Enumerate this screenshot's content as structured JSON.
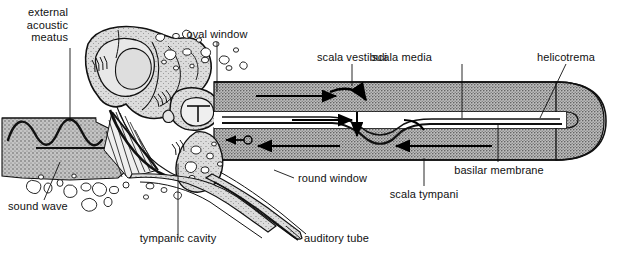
{
  "figure": {
    "type": "anatomical-diagram",
    "width": 622,
    "height": 257,
    "background_color": "#ffffff",
    "ink_color": "#111111",
    "bone_fill": "#c9c9c9",
    "cochlea_fill": "#b5b5b5",
    "duct_fill": "#ffffff",
    "font_size_px": 11
  },
  "labels": {
    "external_acoustic_meatus": "external\nacoustic\nmeatus",
    "oval_window": "oval window",
    "scala_vestibuli": "scala vestibuli",
    "scala_media": "scala media",
    "helicotrema": "helicotrema",
    "basilar_membrane": "basilar membrane",
    "scala_tympani": "scala tympani",
    "round_window": "round window",
    "auditory_tube": "auditory tube",
    "tympanic_cavity": "tympanic cavity",
    "sound_wave": "sound wave"
  },
  "structures": [
    {
      "name": "external-acoustic-meatus",
      "region": "outer-ear-canal"
    },
    {
      "name": "tympanic-membrane",
      "region": "eardrum-fan"
    },
    {
      "name": "tympanic-cavity",
      "region": "middle-ear"
    },
    {
      "name": "auditory-tube",
      "region": "eustachian-tube"
    },
    {
      "name": "oval-window",
      "region": "vestibule-entry"
    },
    {
      "name": "round-window",
      "region": "secondary-tympanic-membrane"
    },
    {
      "name": "scala-vestibuli",
      "region": "upper-cochlear-duct"
    },
    {
      "name": "scala-media",
      "region": "cochlear-duct"
    },
    {
      "name": "scala-tympani",
      "region": "lower-cochlear-duct"
    },
    {
      "name": "basilar-membrane",
      "region": "duct-floor"
    },
    {
      "name": "helicotrema",
      "region": "cochlear-apex"
    }
  ],
  "flow_arrows": [
    {
      "name": "sound-wave-in",
      "direction": "right",
      "region": "external-acoustic-meatus"
    },
    {
      "name": "scala-vestibuli-flow",
      "direction": "right",
      "region": "scala-vestibuli"
    },
    {
      "name": "helicotrema-turn",
      "direction": "down-right",
      "region": "apex"
    },
    {
      "name": "scala-media-flow",
      "direction": "right",
      "region": "scala-media"
    },
    {
      "name": "basilar-deflection",
      "direction": "down",
      "region": "basilar-membrane"
    },
    {
      "name": "scala-tympani-flow-a",
      "direction": "left",
      "region": "scala-tympani"
    },
    {
      "name": "scala-tympani-flow-b",
      "direction": "left",
      "region": "scala-tympani"
    },
    {
      "name": "round-window-out",
      "direction": "left",
      "region": "round-window"
    }
  ]
}
